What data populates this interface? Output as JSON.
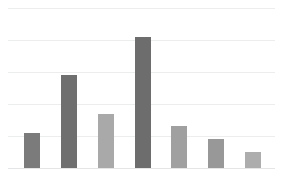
{
  "chart_data": {
    "type": "bar",
    "title": "",
    "subtitle": "",
    "xlabel": "",
    "ylabel": "",
    "categories": [
      "1",
      "2",
      "3",
      "4",
      "5",
      "6",
      "7"
    ],
    "values": [
      1.1,
      2.9,
      1.7,
      4.1,
      1.3,
      0.9,
      0.5
    ],
    "series": [
      {
        "name": "series-1",
        "values": [
          1.1,
          2.9,
          1.7,
          4.1,
          1.3,
          0.9,
          0.5
        ]
      }
    ],
    "ylim": [
      0,
      5
    ],
    "yticks": [
      0,
      1,
      2,
      3,
      4,
      5
    ],
    "xticks": [],
    "tick_labels_visible": false,
    "grid": true,
    "grid_axis": "y",
    "gridline_count": 6,
    "legend": false,
    "legend_position": "none",
    "annotations": [],
    "bar_colors": [
      "#7b7b7b",
      "#6f6f6f",
      "#a9a9a9",
      "#6d6d6d",
      "#a0a0a0",
      "#989898",
      "#adadad"
    ],
    "bar_count": 7
  },
  "figure": {
    "background_color": "#ffffff",
    "gridline_color": "#eceded",
    "baseline_color": "#e4e5e6"
  },
  "caption": {
    "text": "",
    "legible": false,
    "note": "illegible low-resolution caption text beneath plot"
  }
}
